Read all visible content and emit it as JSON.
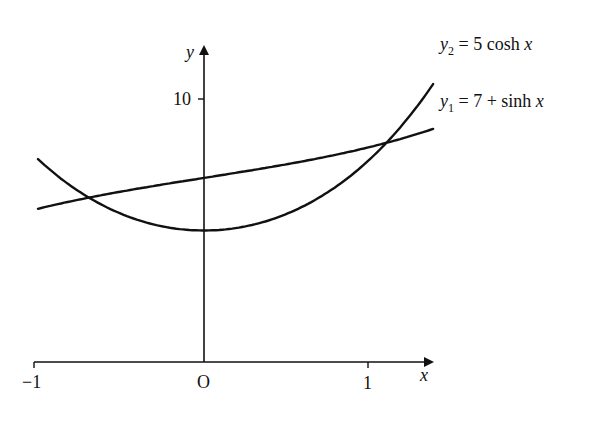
{
  "figure": {
    "y_axis_label": "y",
    "x_axis_label": "x",
    "origin_label": "O",
    "x_tick_labels": [
      "−1",
      "1"
    ],
    "y_tick_labels": [
      "10"
    ],
    "curve_labels": {
      "y2": {
        "var": "y",
        "sub": "2",
        "rest": " = 5 cosh ",
        "xvar": "x"
      },
      "y1": {
        "var": "y",
        "sub": "1",
        "rest": " = 7 + sinh ",
        "xvar": "x"
      }
    },
    "colors": {
      "ink": "#111111",
      "background": "#ffffff"
    }
  },
  "chart_data": {
    "type": "line",
    "title": "",
    "xlabel": "x",
    "ylabel": "y",
    "xlim": [
      -1,
      1.4
    ],
    "ylim": [
      0,
      12
    ],
    "x_ticks": [
      -1,
      0,
      1
    ],
    "y_ticks": [
      10
    ],
    "grid": false,
    "legend_position": "inline labels at right end of curves",
    "series": [
      {
        "name": "y1 = 7 + sinh x",
        "x": [
          -1,
          -0.8,
          -0.6,
          -0.4,
          -0.2,
          0,
          0.2,
          0.4,
          0.6,
          0.8,
          1.0,
          1.2,
          1.4
        ],
        "values": [
          5.82,
          6.11,
          6.36,
          6.59,
          6.8,
          7.0,
          7.2,
          7.41,
          7.64,
          7.89,
          8.18,
          8.51,
          8.9
        ]
      },
      {
        "name": "y2 = 5 cosh x",
        "x": [
          -1,
          -0.8,
          -0.6,
          -0.4,
          -0.2,
          0,
          0.2,
          0.4,
          0.6,
          0.8,
          1.0,
          1.2,
          1.4
        ],
        "values": [
          7.72,
          6.69,
          5.93,
          5.41,
          5.1,
          5.0,
          5.1,
          5.41,
          5.93,
          6.69,
          7.72,
          9.05,
          10.75
        ]
      }
    ],
    "annotations": [
      "y2 = 5 cosh x",
      "y1 = 7 + sinh x",
      "O"
    ]
  }
}
